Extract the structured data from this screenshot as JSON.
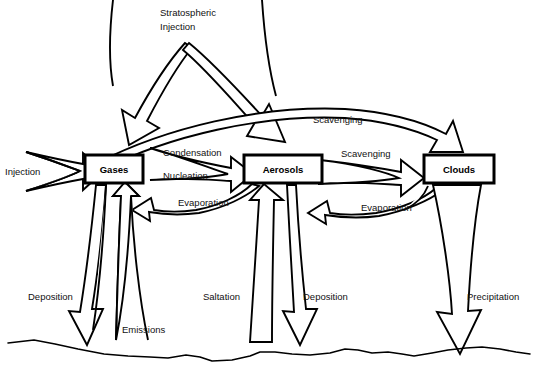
{
  "diagram": {
    "background_color": "#ffffff",
    "stroke_color": "#000000",
    "nodes": [
      {
        "id": "gases",
        "label": "Gases",
        "x": 113,
        "y": 170
      },
      {
        "id": "aerosols",
        "label": "Aerosols",
        "x": 283,
        "y": 170
      },
      {
        "id": "clouds",
        "label": "Clouds",
        "x": 459,
        "y": 170
      }
    ],
    "flows": [
      {
        "id": "injection",
        "label": "Injection",
        "from": "external",
        "to": "gases",
        "x": 5,
        "y": 171
      },
      {
        "id": "stratospheric-injection",
        "label": "Stratospheric",
        "from": "external",
        "to": "gases",
        "x": 160,
        "y": 11
      },
      {
        "id": "stratospheric-injection2",
        "label": "Injection",
        "from": "external",
        "to": "aerosols",
        "x": 160,
        "y": 25
      },
      {
        "id": "condensation",
        "label": "Condensation",
        "from": "gases",
        "to": "aerosols",
        "x": 163,
        "y": 152
      },
      {
        "id": "nucleation",
        "label": "Nucleation",
        "from": "gases",
        "to": "aerosols",
        "x": 163,
        "y": 175
      },
      {
        "id": "evaporation-aerosols",
        "label": "Evaporation",
        "from": "aerosols",
        "to": "gases",
        "x": 178,
        "y": 202
      },
      {
        "id": "scavenging-upper",
        "label": "Scavenging",
        "from": "gases",
        "to": "clouds",
        "x": 313,
        "y": 119
      },
      {
        "id": "scavenging-lower",
        "label": "Scavenging",
        "from": "aerosols",
        "to": "clouds",
        "x": 341,
        "y": 153
      },
      {
        "id": "evaporation-clouds",
        "label": "Evaporation",
        "from": "clouds",
        "to": "aerosols",
        "x": 361,
        "y": 207
      },
      {
        "id": "deposition-gases",
        "label": "Deposition",
        "from": "gases",
        "to": "surface",
        "x": 28,
        "y": 296
      },
      {
        "id": "emissions",
        "label": "Emissions",
        "from": "surface",
        "to": "gases",
        "x": 122,
        "y": 329
      },
      {
        "id": "saltation",
        "label": "Saltation",
        "from": "surface",
        "to": "aerosols",
        "x": 203,
        "y": 296
      },
      {
        "id": "deposition-aerosols",
        "label": "Deposition",
        "from": "aerosols",
        "to": "surface",
        "x": 303,
        "y": 296
      },
      {
        "id": "precipitation",
        "label": "Precipitation",
        "from": "clouds",
        "to": "surface",
        "x": 467,
        "y": 296
      }
    ],
    "surface": {
      "id": "ground",
      "label": ""
    }
  }
}
